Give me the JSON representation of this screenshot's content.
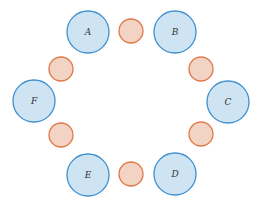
{
  "diagram": {
    "colors": {
      "large_fill": "#cfe4f2",
      "large_stroke": "#3d8fd1",
      "small_fill": "#f2d3c4",
      "small_stroke": "#e07a4a",
      "background": "#ffffff"
    },
    "large_nodes": [
      {
        "label": "A",
        "cx": 88,
        "cy": 32,
        "r": 21
      },
      {
        "label": "B",
        "cx": 175,
        "cy": 32,
        "r": 21
      },
      {
        "label": "C",
        "cx": 228,
        "cy": 102,
        "r": 21
      },
      {
        "label": "D",
        "cx": 175,
        "cy": 174,
        "r": 21
      },
      {
        "label": "E",
        "cx": 88,
        "cy": 175,
        "r": 21
      },
      {
        "label": "F",
        "cx": 34,
        "cy": 101,
        "r": 21
      }
    ],
    "small_nodes": [
      {
        "cx": 131,
        "cy": 31,
        "r": 12
      },
      {
        "cx": 201,
        "cy": 69,
        "r": 12
      },
      {
        "cx": 201,
        "cy": 134,
        "r": 12
      },
      {
        "cx": 131,
        "cy": 174,
        "r": 12
      },
      {
        "cx": 61,
        "cy": 135,
        "r": 12
      },
      {
        "cx": 61,
        "cy": 69,
        "r": 12
      }
    ]
  }
}
